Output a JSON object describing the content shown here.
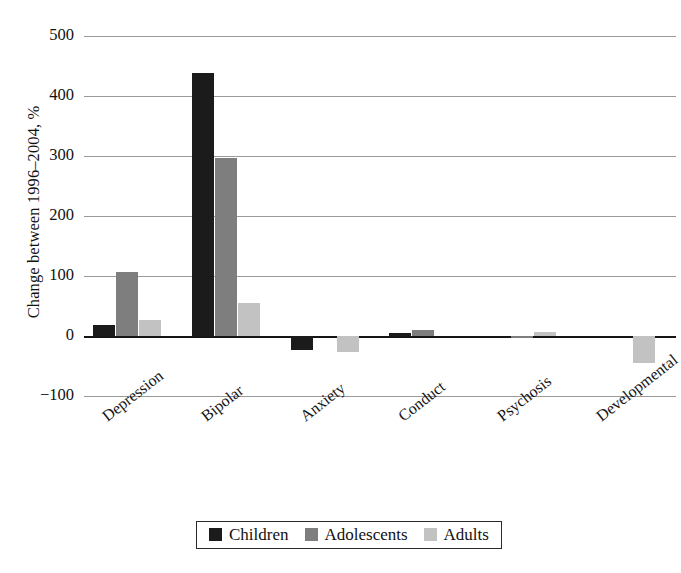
{
  "chart_data": {
    "type": "bar",
    "title": "",
    "xlabel": "",
    "ylabel": "Change between 1996–2004, %",
    "categories": [
      "Depression",
      "Bipolar",
      "Anxiety",
      "Conduct",
      "Psychosis",
      "Developmental"
    ],
    "series": [
      {
        "name": "Children",
        "color": "#1b1b1b",
        "values": [
          18,
          438,
          -23,
          5,
          0,
          0
        ]
      },
      {
        "name": "Adolescents",
        "color": "#7e7e7e",
        "values": [
          107,
          297,
          0,
          10,
          -3,
          0
        ]
      },
      {
        "name": "Adults",
        "color": "#c2c2c2",
        "values": [
          27,
          55,
          -27,
          0,
          7,
          -45
        ]
      }
    ],
    "ylim": [
      -100,
      500
    ],
    "yticks": [
      500,
      400,
      300,
      200,
      100,
      0,
      -100
    ],
    "ytick_labels": [
      "500",
      "400",
      "300",
      "200",
      "100",
      "0",
      "−100"
    ],
    "grid": "horizontal",
    "legend_position": "bottom-center",
    "xtick_rotation": -38
  },
  "legend": {
    "entries": [
      {
        "label": "Children"
      },
      {
        "label": "Adolescents"
      },
      {
        "label": "Adults"
      }
    ]
  }
}
